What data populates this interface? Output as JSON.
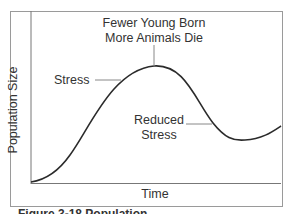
{
  "diagram": {
    "title_annotation": [
      "Fewer Young Born",
      "More Animals Die"
    ],
    "stress_label": "Stress",
    "reduced_stress_label": [
      "Reduced",
      "Stress"
    ],
    "x_axis_label": "Time",
    "y_axis_label": "Population Size",
    "caption": "Figure 3-18  Population ..."
  },
  "colors": {
    "curve": "#2b2b2b",
    "frame": "#8a8a8a",
    "leader": "#888888"
  }
}
